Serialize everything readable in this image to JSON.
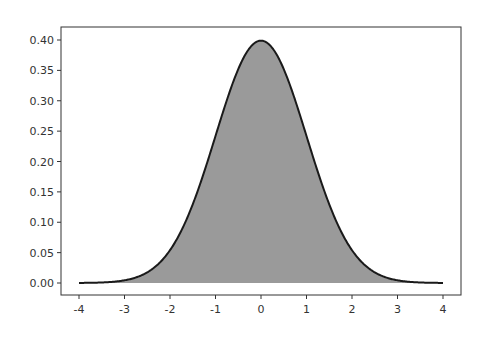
{
  "chart_data": {
    "type": "area",
    "title": "",
    "xlabel": "",
    "ylabel": "",
    "xlim": [
      -4,
      4
    ],
    "ylim": [
      0,
      0.4
    ],
    "grid": false,
    "legend": null,
    "x_ticks": [
      "-4",
      "-3",
      "-2",
      "-1",
      "0",
      "1",
      "2",
      "3",
      "4"
    ],
    "y_ticks": [
      "0.00",
      "0.05",
      "0.10",
      "0.15",
      "0.20",
      "0.25",
      "0.30",
      "0.35",
      "0.40"
    ],
    "x": [
      -4,
      -3.5,
      -3,
      -2.5,
      -2,
      -1.5,
      -1,
      -0.5,
      0,
      0.5,
      1,
      1.5,
      2,
      2.5,
      3,
      3.5,
      4
    ],
    "values": [
      0.0001,
      0.0009,
      0.0044,
      0.0175,
      0.054,
      0.1295,
      0.242,
      0.3521,
      0.3989,
      0.3521,
      0.242,
      0.1295,
      0.054,
      0.0175,
      0.0044,
      0.0009,
      0.0001
    ],
    "colors": {
      "fill": "#9a9a9a",
      "line": "#1a1a1a"
    }
  }
}
